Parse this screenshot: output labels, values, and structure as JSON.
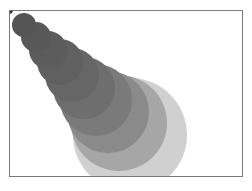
{
  "canvas": {
    "width": 252,
    "height": 191,
    "frame": {
      "x": 9,
      "y": 10,
      "w": 234,
      "h": 167,
      "border": "#7a7a7a"
    }
  },
  "circles": [
    {
      "cx": 9,
      "cy": 10,
      "r": 4,
      "fill": "#333333"
    },
    {
      "cx": 24,
      "cy": 25,
      "r": 12,
      "fill": "#555555"
    },
    {
      "cx": 36,
      "cy": 37,
      "r": 15,
      "fill": "#585858"
    },
    {
      "cx": 48,
      "cy": 50,
      "r": 19,
      "fill": "#5c5c5c"
    },
    {
      "cx": 60,
      "cy": 62,
      "r": 23,
      "fill": "#606060"
    },
    {
      "cx": 72,
      "cy": 75,
      "r": 27,
      "fill": "#666666"
    },
    {
      "cx": 84,
      "cy": 88,
      "r": 31,
      "fill": "#6e6e6e"
    },
    {
      "cx": 96,
      "cy": 100,
      "r": 36,
      "fill": "#7a7a7a"
    },
    {
      "cx": 108,
      "cy": 112,
      "r": 41,
      "fill": "#8a8a8a"
    },
    {
      "cx": 119,
      "cy": 123,
      "r": 48,
      "fill": "#a6a6a6"
    },
    {
      "cx": 130,
      "cy": 135,
      "r": 57,
      "fill": "#d0d0d0"
    }
  ]
}
